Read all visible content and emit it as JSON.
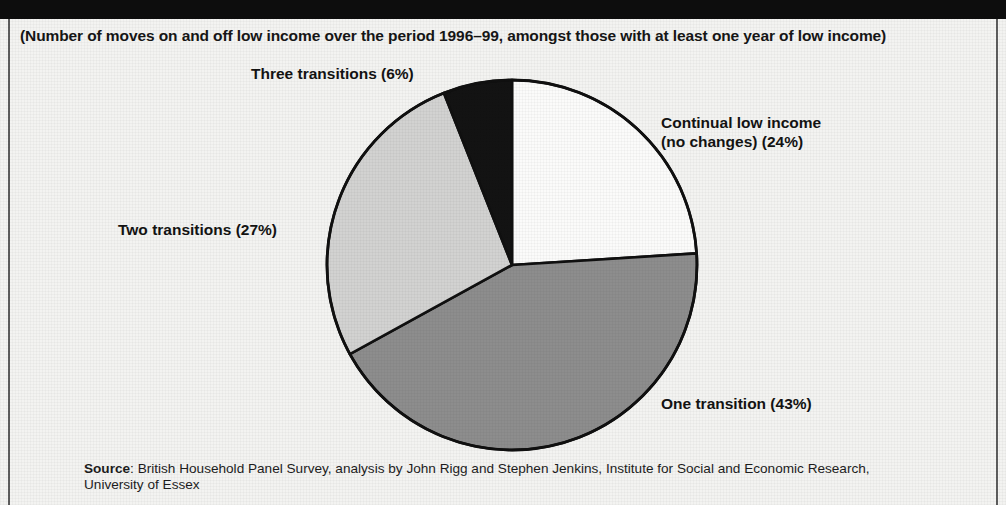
{
  "subtitle": "(Number of moves on and off low income over the period 1996–99, amongst those with at least one year of low income)",
  "labels": {
    "three_transitions": "Three transitions (6%)",
    "continual_line1": "Continual low income",
    "continual_line2": "(no changes) (24%)",
    "two_transitions": "Two transitions (27%)",
    "one_transition": "One transition (43%)"
  },
  "source": {
    "lead": "Source",
    "text": ": British Household Panel Survey, analysis by John Rigg and Stephen Jenkins, Institute for Social and Economic Research, University of Essex"
  },
  "colors": {
    "banner": "#0d0d0d",
    "paper": "#f3f3f1",
    "slice_continual": "#fbfbfa",
    "slice_one": "#8d8d8d",
    "slice_two": "#d2d2d1",
    "slice_three": "#131313",
    "outline": "#101010",
    "text": "#161616"
  },
  "chart_data": {
    "type": "pie",
    "title": "",
    "subtitle": "(Number of moves on and off low income over the period 1996–99, amongst those with at least one year of low income)",
    "start_angle_deg": 0,
    "direction": "clockwise",
    "unit": "percent",
    "categories": [
      "Continual low income (no changes)",
      "One transition",
      "Two transitions",
      "Three transitions"
    ],
    "values": [
      24,
      43,
      27,
      6
    ],
    "slices": [
      {
        "label": "Continual low income (no changes) (24%)",
        "value": 24,
        "color": "#fbfbfa",
        "label_position": "right-top"
      },
      {
        "label": "One transition (43%)",
        "value": 43,
        "color": "#8d8d8d",
        "label_position": "right-bottom"
      },
      {
        "label": "Two transitions (27%)",
        "value": 27,
        "color": "#d2d2d1",
        "label_position": "left"
      },
      {
        "label": "Three transitions (6%)",
        "value": 6,
        "color": "#131313",
        "label_position": "top-left"
      }
    ],
    "legend": "none (direct labels)",
    "grid": false,
    "source": "Source: British Household Panel Survey, analysis by John Rigg and Stephen Jenkins, Institute for Social and Economic Research, University of Essex"
  }
}
